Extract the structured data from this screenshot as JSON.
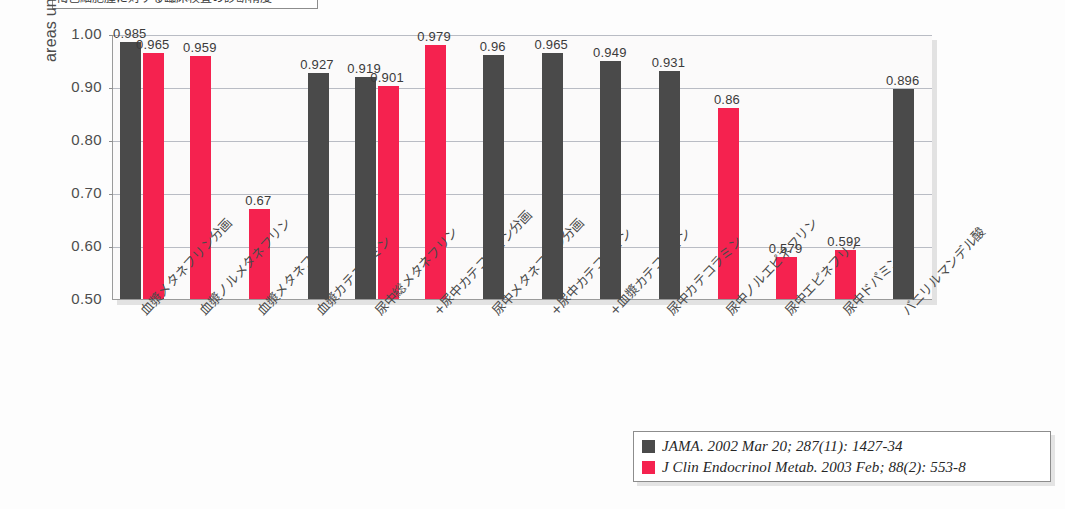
{
  "title": {
    "text": "褐色細胞腫に対する臨床検査の診断精度"
  },
  "legend": {
    "position": "bottom-right",
    "entries": [
      {
        "label": "JAMA. 2002 Mar 20; 287(11): 1427-34",
        "color": "#4a4a4a",
        "swatch": "dark-gray-swatch"
      },
      {
        "label": "J Clin Endocrinol Metab. 2003 Feb; 88(2): 553-8",
        "color": "#f5224f",
        "swatch": "pink-swatch"
      }
    ]
  },
  "chart_data": {
    "type": "bar",
    "title": "褐色細胞腫に対する臨床検査の診断精度",
    "xlabel": "",
    "ylabel": "areas under the ROC curves",
    "ylim": [
      0.5,
      1.0
    ],
    "yticks": [
      "0.50",
      "0.60",
      "0.70",
      "0.80",
      "0.90",
      "1.00"
    ],
    "grid": true,
    "categories": [
      "血漿メタネフリン分画",
      "血漿ノルメタネフリン",
      "血漿メタネフリン",
      "血漿カテコラミン",
      "尿中総メタネフリン",
      "+尿中カテコラミン分画",
      "尿中メタネフリン分画",
      "+尿中カテコラミン",
      "+血漿カテコラミン",
      "尿中カテコラミン",
      "尿中ノルエピネフリン",
      "尿中エピネフリン",
      "尿中ドパミン",
      "バニリルマンデル酸"
    ],
    "series": [
      {
        "name": "JAMA. 2002 Mar 20; 287(11): 1427-34",
        "color": "#4a4a4a",
        "values": [
          0.985,
          null,
          null,
          0.927,
          0.919,
          null,
          0.96,
          0.965,
          0.949,
          0.931,
          null,
          null,
          null,
          0.896
        ],
        "labels": [
          "0.985",
          "",
          "",
          "0.927",
          "0.919",
          "",
          "0.96",
          "0.965",
          "0.949",
          "0.931",
          "",
          "",
          "",
          "0.896"
        ]
      },
      {
        "name": "J Clin Endocrinol Metab. 2003 Feb; 88(2): 553-8",
        "color": "#f5224f",
        "values": [
          0.965,
          0.959,
          0.67,
          null,
          0.901,
          0.979,
          null,
          null,
          null,
          null,
          0.86,
          0.579,
          0.592,
          null
        ],
        "labels": [
          "0.965",
          "0.959",
          "0.67",
          "",
          "0.901",
          "0.979",
          "",
          "",
          "",
          "",
          "0.86",
          "0.579",
          "0.592",
          ""
        ]
      }
    ]
  }
}
